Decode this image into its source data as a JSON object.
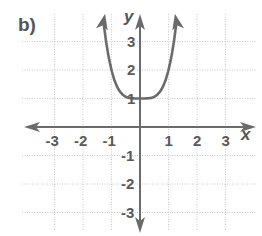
{
  "panel_label": "b)",
  "chart_data": {
    "type": "line",
    "title": "b)",
    "function": "y = x^4 + 1",
    "xlabel": "x",
    "ylabel": "y",
    "xlim": [
      -3.5,
      3.5
    ],
    "ylim": [
      -3.5,
      3.5
    ],
    "grid": true,
    "grid_style": "dotted",
    "x_ticks": [
      -3,
      -2,
      -1,
      1,
      2,
      3
    ],
    "y_ticks": [
      -3,
      -2,
      -1,
      1,
      2,
      3
    ],
    "x_tick_labels": [
      "-3",
      "-2",
      "-1",
      "1",
      "2",
      "3"
    ],
    "y_tick_labels": [
      "-3",
      "-2",
      "-1",
      "1",
      "2",
      "3"
    ],
    "series": [
      {
        "name": "curve",
        "x": [
          -1.45,
          -1.3,
          -1.2,
          -1.0,
          -0.8,
          -0.5,
          0,
          0.5,
          0.8,
          1.0,
          1.2,
          1.3,
          1.45
        ],
        "y": [
          3.42,
          2.86,
          2.07,
          2.0,
          1.41,
          1.06,
          1.0,
          1.06,
          1.41,
          2.0,
          3.07,
          3.86,
          5.42
        ],
        "arrows_at_ends": true,
        "color": "#6b6b6b"
      }
    ]
  },
  "colors": {
    "axis": "#6b6b6b",
    "grid": "#c8c8c8",
    "curve": "#6b6b6b",
    "text": "#555555"
  }
}
